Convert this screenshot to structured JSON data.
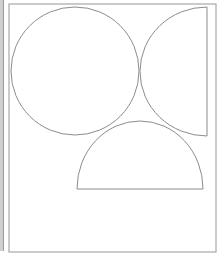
{
  "diagram": {
    "stroke_color": "#8c8c8c",
    "frame_color": "#a8a8a8",
    "strip_color": "#cfcfcf",
    "frame": {
      "x": 9,
      "y": 4,
      "width": 207,
      "height": 248
    },
    "shapes": [
      {
        "type": "circle",
        "name": "full-circle",
        "cx": 75,
        "cy": 71,
        "r": 64
      },
      {
        "type": "half-circle-left",
        "name": "right-half-circle",
        "flat_x": 207,
        "top_y": 7,
        "bottom_y": 136,
        "bulge_x": 140
      },
      {
        "type": "half-ellipse-top",
        "name": "bottom-semicircle",
        "left_x": 77,
        "right_x": 203,
        "flat_y": 189,
        "top_y": 121
      }
    ]
  }
}
